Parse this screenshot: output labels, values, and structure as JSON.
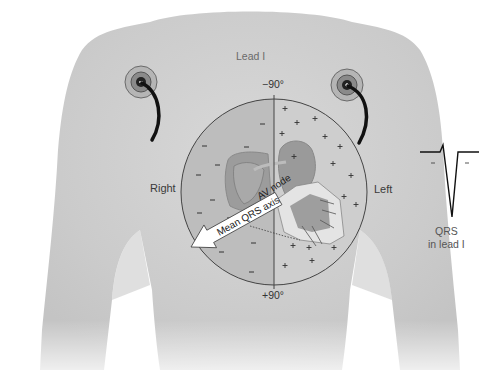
{
  "diagram": {
    "title": "Lead I",
    "labels": {
      "lead": "Lead I",
      "top_angle": "−90°",
      "bottom_angle": "+90°",
      "right": "Right",
      "left": "Left",
      "av_node": "AV node",
      "axis_arrow": "Mean QRS axis",
      "qrs_line1": "QRS",
      "qrs_line2": "in lead I"
    },
    "electrodes": [
      {
        "side": "right",
        "polarity": "negative",
        "symbol": "−"
      },
      {
        "side": "left",
        "polarity": "positive",
        "symbol": "+"
      }
    ],
    "circle": {
      "left_half": "negative",
      "right_half": "positive",
      "negative_symbol": "−",
      "positive_symbol": "+"
    },
    "qrs_waveform": {
      "description": "small upward notch then deep negative deflection",
      "marks": [
        "−",
        "−"
      ]
    },
    "colors": {
      "background": "#ffffff",
      "torso": "#d2d2d2",
      "circle_left": "#bdbdbd",
      "circle_right": "#cfcfcf",
      "line": "#333333",
      "arrow_fill": "#ffffff"
    }
  }
}
